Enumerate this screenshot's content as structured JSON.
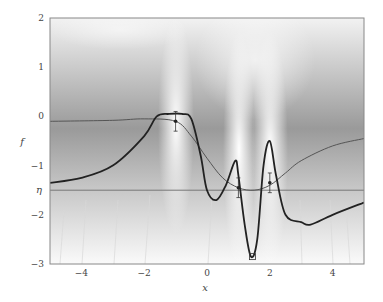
{
  "chart_data": {
    "type": "line",
    "title": "",
    "xlabel": "x",
    "ylabel": "f",
    "xlim": [
      -5,
      5
    ],
    "ylim": [
      -3,
      2
    ],
    "xticks": [
      -4,
      -2,
      0,
      2,
      4
    ],
    "yticks": [
      2,
      1,
      0,
      -1,
      -2,
      -3
    ],
    "ytick_labels": [
      "2",
      "1",
      "0",
      "−1",
      "−2",
      "−3"
    ],
    "xtick_labels": [
      "−4",
      "−2",
      "0",
      "2",
      "4"
    ],
    "threshold": {
      "label": "η",
      "value": -1.5
    },
    "grid": false,
    "legend": null,
    "series": [
      {
        "name": "true function",
        "style": "thick dark line",
        "x": [
          -5,
          -4,
          -3,
          -2,
          -1.6,
          -1.2,
          -0.8,
          -0.5,
          -0.2,
          0,
          0.3,
          0.6,
          0.9,
          1.0,
          1.2,
          1.4,
          1.6,
          1.8,
          2.0,
          2.2,
          2.5,
          3.0,
          3.3,
          4.0,
          5.0
        ],
        "y": [
          -1.35,
          -1.25,
          -1.0,
          -0.4,
          0.0,
          0.05,
          0.05,
          -0.05,
          -0.8,
          -1.5,
          -1.7,
          -1.4,
          -0.9,
          -1.2,
          -2.2,
          -2.85,
          -2.5,
          -1.0,
          -0.5,
          -1.2,
          -2.0,
          -2.15,
          -2.2,
          -2.0,
          -1.75
        ]
      },
      {
        "name": "posterior mean",
        "style": "thin line",
        "x": [
          -5,
          -3,
          -2,
          -1,
          -0.5,
          0,
          0.5,
          1.0,
          1.5,
          2.0,
          2.5,
          3.0,
          4.0,
          5.0
        ],
        "y": [
          -0.1,
          -0.08,
          -0.05,
          -0.1,
          -0.4,
          -0.85,
          -1.25,
          -1.45,
          -1.5,
          -1.4,
          -1.15,
          -0.9,
          -0.6,
          -0.45
        ]
      }
    ],
    "observations": [
      {
        "x": -1.0,
        "y": -0.1,
        "err": 0.2
      },
      {
        "x": 1.0,
        "y": -1.45,
        "err": 0.2
      },
      {
        "x": 2.0,
        "y": -1.35,
        "err": 0.2
      }
    ],
    "marker": {
      "shape": "square",
      "x": 1.45,
      "y": -2.85
    },
    "shading": "grayscale posterior density with light sample paths below η"
  }
}
